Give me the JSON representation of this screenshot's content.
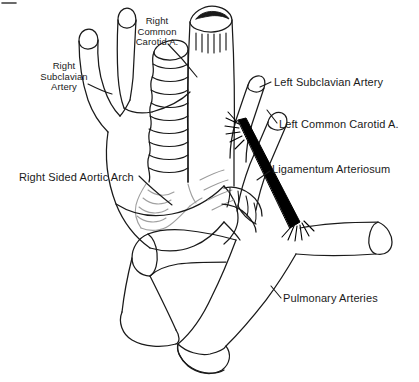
{
  "figure": {
    "title_present": false,
    "background_color": "#ffffff",
    "ink_color": "#1a1a1a",
    "accent_color": "#000000",
    "faint_color": "#9a9a9a",
    "width": 419,
    "height": 382
  },
  "labels": {
    "right_common_carotid": {
      "text": "Right\nCommon\nCarotid A.",
      "x": 126,
      "y": 16,
      "align": "center"
    },
    "right_subclavian": {
      "text": "Right\nSubclavian\nArtery",
      "x": 28,
      "y": 61,
      "align": "center"
    },
    "right_sided_aortic_arch": {
      "text": "Right Sided Aortic Arch",
      "x": 19,
      "y": 171,
      "align": "left"
    },
    "left_subclavian": {
      "text": "Left Subclavian Artery",
      "x": 274,
      "y": 76,
      "align": "left"
    },
    "left_common_carotid": {
      "text": "Left Common Carotid A.",
      "x": 279,
      "y": 118,
      "align": "left"
    },
    "ligamentum_arteriosum": {
      "text": "Ligamentum Arteriosum",
      "x": 272,
      "y": 163,
      "align": "left"
    },
    "pulmonary_arteries": {
      "text": "Pulmonary Arteries",
      "x": 283,
      "y": 292,
      "align": "left"
    }
  },
  "structures": [
    {
      "name": "trachea",
      "description": "Central vertical tube with cut lumen and mucosal striations at top"
    },
    {
      "name": "esophagus",
      "description": "Ringed corrugated tube anterior-left of trachea"
    },
    {
      "name": "innominate-trunk",
      "description": "Right brachiocephalic trunk dividing into two branches"
    },
    {
      "name": "right-common-carotid-artery",
      "description": "Right upper branch vessel"
    },
    {
      "name": "right-subclavian-artery",
      "description": "Left upper branch vessel"
    },
    {
      "name": "right-sided-aortic-arch",
      "description": "Aortic arch passing to the right side"
    },
    {
      "name": "left-subclavian-artery",
      "description": "Branch on the right of image arising superiorly"
    },
    {
      "name": "left-common-carotid-artery",
      "description": "Branch on the right of image arising below subclavian"
    },
    {
      "name": "ligamentum-arteriosum",
      "description": "Thick black fibrous band from aorta to pulmonary artery"
    },
    {
      "name": "main-pulmonary-trunk",
      "description": "Large cut cylinder at bottom center"
    },
    {
      "name": "right-pulmonary-artery",
      "description": "Cut cylinder stump to the right"
    },
    {
      "name": "left-pulmonary-artery",
      "description": "Cut cylinder stump to the lower left"
    }
  ],
  "leader_lines": [
    {
      "name": "leader-right-common-carotid",
      "from": [
        168,
        44
      ],
      "to": [
        196,
        76
      ]
    },
    {
      "name": "leader-right-subclavian",
      "from": [
        88,
        82
      ],
      "to": [
        110,
        92
      ]
    },
    {
      "name": "leader-right-sided-aortic-arch",
      "from": [
        140,
        176
      ],
      "to": [
        172,
        200
      ]
    },
    {
      "name": "leader-left-subclavian",
      "from": [
        272,
        82
      ],
      "to": [
        258,
        88
      ]
    },
    {
      "name": "leader-left-common-carotid",
      "from": [
        276,
        122
      ],
      "to": [
        268,
        112
      ]
    },
    {
      "name": "leader-ligamentum-arteriosum",
      "from": [
        270,
        170
      ],
      "to": [
        258,
        178
      ]
    },
    {
      "name": "leader-pulmonary-arteries",
      "from": [
        281,
        297
      ],
      "to": [
        272,
        286
      ]
    }
  ]
}
